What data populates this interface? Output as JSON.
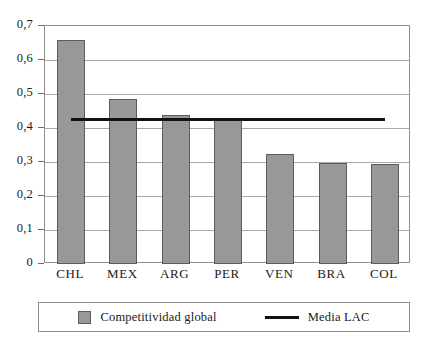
{
  "chart_data": {
    "type": "bar",
    "title": "",
    "subtitle": "",
    "xlabel": "",
    "ylabel": "",
    "categories": [
      "CHL",
      "MEX",
      "ARG",
      "PER",
      "VEN",
      "BRA",
      "COL"
    ],
    "series": [
      {
        "name": "Competitividad global",
        "type": "bar",
        "color": "#989898",
        "values": [
          0.66,
          0.485,
          0.438,
          0.426,
          0.325,
          0.296,
          0.293
        ]
      },
      {
        "name": "Media LAC",
        "type": "line",
        "color": "#111111",
        "value": 0.426
      }
    ],
    "ylim": [
      0,
      0.7
    ],
    "ytick_values": [
      0.7,
      0.6,
      0.5,
      0.4,
      0.3,
      0.2,
      0.1,
      0
    ],
    "ytick_labels": [
      "0,7",
      "0,6",
      "0,5",
      "0,4",
      "0,3",
      "0,2",
      "0,1",
      "0"
    ],
    "grid": true,
    "grid_axis": "y",
    "legend_position": "bottom",
    "decimal_separator": ","
  },
  "legend": {
    "entries": [
      {
        "label": "Competitividad global",
        "marker": "square-swatch-icon"
      },
      {
        "label": "Media LAC",
        "marker": "line-marker-icon"
      }
    ]
  }
}
